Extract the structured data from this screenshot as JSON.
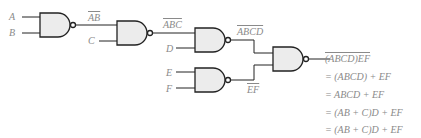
{
  "inputs": {
    "A": "A",
    "B": "B",
    "C": "C",
    "D": "D",
    "E": "E",
    "F": "F"
  },
  "intermediate": {
    "ab": "AB",
    "abc": "ABC",
    "abcd": "ABCD",
    "ef": "EF"
  },
  "output_equations": [
    "(ABCD)EF",
    "= (ABCD) + EF",
    "= ABCD + EF",
    "= (AB + C)D + EF",
    "= (AB + C)D + EF"
  ],
  "colors": {
    "line": "#222222",
    "gate_fill": "#ececec",
    "text": "#8a8a8a"
  }
}
